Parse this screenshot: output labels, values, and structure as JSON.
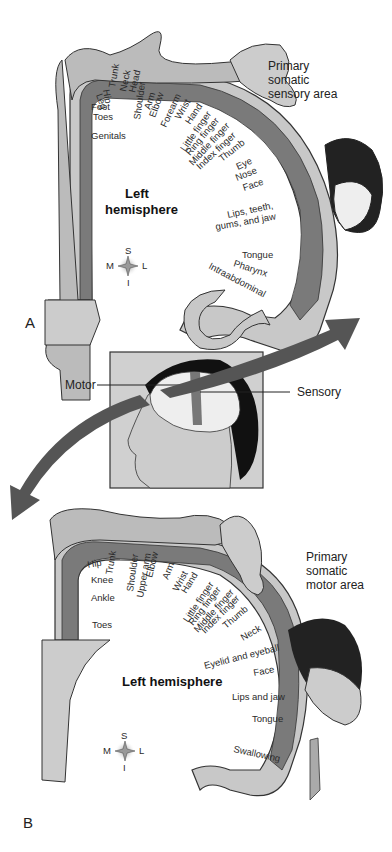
{
  "panel_a": {
    "letter": "A",
    "area_title": [
      "Primary",
      "somatic",
      "sensory area"
    ],
    "hemisphere": [
      "Left",
      "hemisphere"
    ],
    "compass": {
      "s": "S",
      "i": "I",
      "m": "M",
      "l": "L"
    },
    "labels": [
      "Leg",
      "Hip",
      "Trunk",
      "Neck",
      "Head",
      "Shoulder",
      "Arm",
      "Elbow",
      "Forearm",
      "Wrist",
      "Hand",
      "Little finger",
      "Ring finger",
      "Middle finger",
      "Index finger",
      "Thumb",
      "Eye",
      "Nose",
      "Face",
      "Lips, teeth,",
      "gums, and jaw",
      "Tongue",
      "Pharynx",
      "Intraabdominal",
      "Foot",
      "Toes",
      "Genitals"
    ]
  },
  "center": {
    "motor_label": "Motor",
    "sensory_label": "Sensory"
  },
  "panel_b": {
    "letter": "B",
    "area_title": [
      "Primary",
      "somatic",
      "motor area"
    ],
    "hemisphere": "Left hemisphere",
    "compass": {
      "s": "S",
      "i": "I",
      "m": "M",
      "l": "L"
    },
    "labels": [
      "Hip",
      "Trunk",
      "Knee",
      "Ankle",
      "Toes",
      "Shoulder",
      "Upper arm",
      "Elbow",
      "Arm",
      "Wrist",
      "Hand",
      "Little finger",
      "Ring finger",
      "Middle finger",
      "Index finger",
      "Thumb",
      "Neck",
      "Eyelid and eyeball",
      "Face",
      "Lips and jaw",
      "Tongue",
      "Swallowing"
    ]
  }
}
